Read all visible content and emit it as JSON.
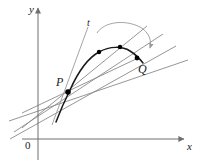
{
  "figure": {
    "background": "#ffffff",
    "width": 202,
    "height": 168,
    "colors": {
      "axis": "#6e6e6e",
      "secant": "#8a8a8a",
      "tangent": "#1a1a1a",
      "curve": "#1a1a1a",
      "point": "#000000",
      "arrow": "#9a9a9a",
      "label": "#1a1a1a"
    }
  },
  "axes": {
    "x_label": "x",
    "y_label": "y",
    "origin_label": "0",
    "x_axis": {
      "x1": 22,
      "y1": 139,
      "x2": 186,
      "y2": 139
    },
    "y_axis": {
      "x1": 38,
      "y1": 158,
      "x2": 38,
      "y2": 6
    }
  },
  "labels": {
    "point_p": "P",
    "point_q": "Q",
    "tangent": "t"
  },
  "points": [
    {
      "name": "P",
      "x": 68,
      "y": 92,
      "r": 2.6
    },
    {
      "name": "R3",
      "x": 99,
      "y": 52,
      "r": 2.2
    },
    {
      "name": "R2",
      "x": 120,
      "y": 47,
      "r": 2.2
    },
    {
      "name": "Q",
      "x": 137,
      "y": 58,
      "r": 2.4
    }
  ],
  "curve": {
    "description": "arc through P rising to a maximum then descending to Q",
    "path": "M 56 122 C 62 106, 66 98, 70 90 C 78 72, 88 58, 99 52 C 110 46, 122 46, 130 51 C 135 54, 139 58, 143 63"
  },
  "tangent_line": {
    "label": "t",
    "x1": 88,
    "y1": 27,
    "x2": 52,
    "y2": 125
  },
  "secant_lines": [
    {
      "x1": 22,
      "y1": 128,
      "x2": 147,
      "y2": 26
    },
    {
      "x1": 14,
      "y1": 132,
      "x2": 163,
      "y2": 34
    },
    {
      "x1": 10,
      "y1": 139,
      "x2": 176,
      "y2": 46
    },
    {
      "x1": 9,
      "y1": 121,
      "x2": 188,
      "y2": 60
    },
    {
      "x1": 22,
      "y1": 113,
      "x2": 136,
      "y2": 59
    }
  ],
  "rotation_arrow": {
    "description": "curved arrow from tangent direction sweeping toward the secant directions",
    "path": "M 97 33 C 104 22, 124 19, 140 27 C 150 32, 152 41, 150 48"
  }
}
